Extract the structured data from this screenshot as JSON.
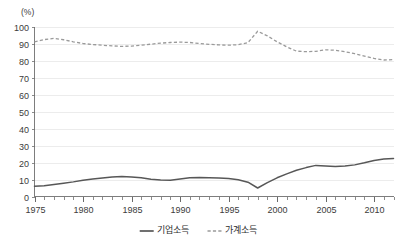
{
  "chart_data": {
    "type": "line",
    "title": "",
    "subtitle": "",
    "xlabel": "",
    "ylabel": "",
    "unit_label": "(%)",
    "xlim": [
      1975,
      2012
    ],
    "ylim": [
      0,
      100
    ],
    "y_ticks": [
      0,
      10,
      20,
      30,
      40,
      50,
      60,
      70,
      80,
      90,
      100
    ],
    "y_tick_labels": [
      "0",
      "10",
      "20",
      "30",
      "40",
      "50",
      "60",
      "70",
      "80",
      "90",
      "100"
    ],
    "x_ticks": [
      1975,
      1980,
      1985,
      1990,
      1995,
      2000,
      2005,
      2010
    ],
    "x_tick_labels": [
      "1975",
      "1980",
      "1985",
      "1990",
      "1995",
      "2000",
      "2005",
      "2010"
    ],
    "x_minor_tick_step": 1,
    "grid": "horizontal",
    "legend_position": "bottom-center",
    "x": [
      1975,
      1976,
      1977,
      1978,
      1979,
      1980,
      1981,
      1982,
      1983,
      1984,
      1985,
      1986,
      1987,
      1988,
      1989,
      1990,
      1991,
      1992,
      1993,
      1994,
      1995,
      1996,
      1997,
      1998,
      1999,
      2000,
      2001,
      2002,
      2003,
      2004,
      2005,
      2006,
      2007,
      2008,
      2009,
      2010,
      2011,
      2012
    ],
    "series": [
      {
        "name": "기업소득",
        "style": "solid",
        "color": "#575757",
        "values": [
          6.0,
          6.3,
          7.0,
          7.8,
          8.6,
          9.6,
          10.3,
          10.9,
          11.4,
          11.7,
          11.5,
          11.0,
          10.2,
          9.7,
          9.6,
          10.3,
          11.0,
          11.2,
          11.1,
          10.9,
          10.6,
          9.8,
          8.4,
          5.0,
          8.2,
          11.0,
          13.3,
          15.4,
          17.0,
          18.3,
          18.0,
          17.6,
          17.9,
          18.6,
          19.8,
          21.2,
          22.0,
          22.3
        ]
      },
      {
        "name": "가계소득",
        "style": "dashed",
        "color": "#9a9a9a",
        "values": [
          91.0,
          92.3,
          93.0,
          92.2,
          91.0,
          90.0,
          89.4,
          89.0,
          88.6,
          88.3,
          88.5,
          89.0,
          89.6,
          90.2,
          90.6,
          90.8,
          90.6,
          90.0,
          89.5,
          89.2,
          89.0,
          89.3,
          90.5,
          97.2,
          94.5,
          91.0,
          88.0,
          85.5,
          85.2,
          85.4,
          86.3,
          86.0,
          85.2,
          84.0,
          82.6,
          81.2,
          80.3,
          80.5
        ]
      }
    ]
  },
  "legend": {
    "items": [
      {
        "label": "기업소득",
        "style": "solid"
      },
      {
        "label": "가계소득",
        "style": "dashed"
      }
    ]
  }
}
